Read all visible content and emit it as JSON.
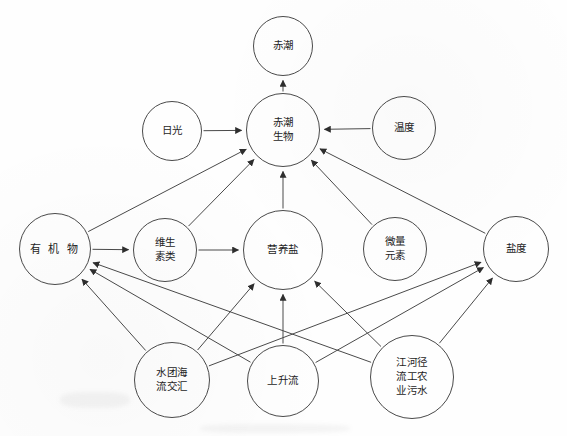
{
  "diagram": {
    "type": "directed-graph",
    "background_color": "#fefefe",
    "stroke_color": "#4a4a4a",
    "text_color": "#1d1d1d",
    "nodes": [
      {
        "id": "red_tide",
        "label": "赤潮",
        "cx": 283,
        "cy": 46,
        "r": 30,
        "lines": 1,
        "style": "small"
      },
      {
        "id": "red_tide_org",
        "label": "赤潮\n生物",
        "cx": 283,
        "cy": 130,
        "r": 37,
        "lines": 2,
        "style": "small"
      },
      {
        "id": "sunlight",
        "label": "日光",
        "cx": 172,
        "cy": 131,
        "r": 30,
        "lines": 1,
        "style": "small"
      },
      {
        "id": "temperature",
        "label": "温度",
        "cx": 404,
        "cy": 128,
        "r": 32,
        "lines": 1,
        "style": "small"
      },
      {
        "id": "organic",
        "label": "有 机 物",
        "cx": 55,
        "cy": 249,
        "r": 36,
        "lines": 1,
        "style": "wide"
      },
      {
        "id": "vitamins",
        "label": "维生\n素类",
        "cx": 165,
        "cy": 250,
        "r": 32,
        "lines": 2,
        "style": "small"
      },
      {
        "id": "nutrients",
        "label": "营养盐",
        "cx": 283,
        "cy": 250,
        "r": 40,
        "lines": 1,
        "style": "small"
      },
      {
        "id": "trace_el",
        "label": "微量\n元素",
        "cx": 395,
        "cy": 249,
        "r": 32,
        "lines": 2,
        "style": "small"
      },
      {
        "id": "salinity",
        "label": "盐度",
        "cx": 516,
        "cy": 249,
        "r": 33,
        "lines": 1,
        "style": "small"
      },
      {
        "id": "water_mass",
        "label": "水团海\n流交汇",
        "cx": 172,
        "cy": 380,
        "r": 38,
        "lines": 2,
        "style": "small"
      },
      {
        "id": "upwelling",
        "label": "上升流",
        "cx": 283,
        "cy": 381,
        "r": 36,
        "lines": 1,
        "style": "small"
      },
      {
        "id": "river_waste",
        "label": "江河径\n流工农\n业污水",
        "cx": 412,
        "cy": 377,
        "r": 42,
        "lines": 3,
        "style": "small"
      }
    ],
    "edges": [
      {
        "from": "red_tide_org",
        "to": "red_tide",
        "arrow": true
      },
      {
        "from": "sunlight",
        "to": "red_tide_org",
        "arrow": true
      },
      {
        "from": "temperature",
        "to": "red_tide_org",
        "arrow": true
      },
      {
        "from": "organic",
        "to": "red_tide_org",
        "arrow": true
      },
      {
        "from": "vitamins",
        "to": "red_tide_org",
        "arrow": true
      },
      {
        "from": "nutrients",
        "to": "red_tide_org",
        "arrow": true
      },
      {
        "from": "trace_el",
        "to": "red_tide_org",
        "arrow": true
      },
      {
        "from": "salinity",
        "to": "red_tide_org",
        "arrow": true
      },
      {
        "from": "organic",
        "to": "vitamins",
        "arrow": true
      },
      {
        "from": "vitamins",
        "to": "nutrients",
        "arrow": true
      },
      {
        "from": "water_mass",
        "to": "organic",
        "arrow": true
      },
      {
        "from": "upwelling",
        "to": "organic",
        "arrow": true
      },
      {
        "from": "river_waste",
        "to": "organic",
        "arrow": true
      },
      {
        "from": "water_mass",
        "to": "nutrients",
        "arrow": true
      },
      {
        "from": "upwelling",
        "to": "nutrients",
        "arrow": true
      },
      {
        "from": "river_waste",
        "to": "nutrients",
        "arrow": true
      },
      {
        "from": "water_mass",
        "to": "salinity",
        "arrow": true
      },
      {
        "from": "upwelling",
        "to": "salinity",
        "arrow": true
      },
      {
        "from": "river_waste",
        "to": "salinity",
        "arrow": true
      }
    ]
  }
}
